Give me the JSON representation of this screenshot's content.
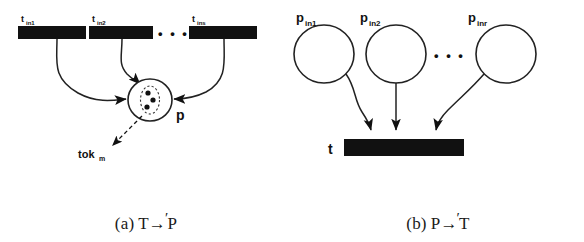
{
  "figure": {
    "panels": [
      {
        "id": "panel-a",
        "caption_index": "(a)",
        "caption_left": "T",
        "caption_arrow": "→",
        "caption_prime": "′",
        "caption_right": "P",
        "transitions": [
          {
            "label_main": "t",
            "label_sub": "in1"
          },
          {
            "label_main": "t",
            "label_sub": "in2"
          },
          {
            "label_main": "t",
            "label_sub": "ins"
          }
        ],
        "ellipsis": "• • •",
        "place": {
          "label": "p",
          "token_count": 3
        },
        "token_annotation": {
          "label_main": "tok",
          "label_sub": "m"
        }
      },
      {
        "id": "panel-b",
        "caption_index": "(b)",
        "caption_left": "P",
        "caption_arrow": "→",
        "caption_prime": "′",
        "caption_right": "T",
        "places": [
          {
            "label_main": "p",
            "label_sub": "in1"
          },
          {
            "label_main": "p",
            "label_sub": "in2"
          },
          {
            "label_main": "p",
            "label_sub": "inr"
          }
        ],
        "ellipsis": "• • •",
        "transition": {
          "label": "t"
        }
      }
    ]
  },
  "colors": {
    "ink": "#111111",
    "paper": "#ffffff",
    "bar_fill": "#111111",
    "stroke": "#222222"
  }
}
